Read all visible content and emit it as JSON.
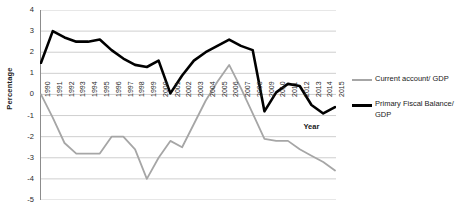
{
  "chart_data": {
    "type": "line",
    "title": "",
    "xlabel": "Year",
    "ylabel": "Percentage",
    "ylim": [
      -5,
      4
    ],
    "ytick_labels": [
      "4",
      "3",
      "2",
      "1",
      "0",
      "-1",
      "-2",
      "-3",
      "-4",
      "-5"
    ],
    "yticks": [
      4,
      3,
      2,
      1,
      0,
      -1,
      -2,
      -3,
      -4,
      -5
    ],
    "grid": true,
    "legend_position": "right",
    "x": [
      1990,
      1991,
      1992,
      1993,
      1994,
      1995,
      1996,
      1997,
      1998,
      1999,
      2000,
      2001,
      2002,
      2003,
      2004,
      2005,
      2006,
      2007,
      2008,
      2009,
      2010,
      2011,
      2012,
      2013,
      2014,
      2015
    ],
    "categories": [
      "1990",
      "1991",
      "1992",
      "1993",
      "1994",
      "1995",
      "1996",
      "1997",
      "1998",
      "1999",
      "2000",
      "2001",
      "2002",
      "2003",
      "2004",
      "2005",
      "2006",
      "2007",
      "2008",
      "2009",
      "2010",
      "2011",
      "2012",
      "2013",
      "2014",
      "2015"
    ],
    "series": [
      {
        "name": "Current account/ GDP",
        "color": "#a6a6a6",
        "width": 1.8,
        "values": [
          0.0,
          -1.1,
          -2.3,
          -2.8,
          -2.8,
          -2.8,
          -2.0,
          -2.0,
          -2.6,
          -4.0,
          -3.0,
          -2.2,
          -2.5,
          -1.4,
          -0.3,
          0.6,
          1.4,
          0.3,
          -0.9,
          -2.1,
          -2.2,
          -2.2,
          -2.6,
          -2.9,
          -3.2,
          -3.6
        ]
      },
      {
        "name": "Primary Fiscal Balance/ GDP",
        "color": "#000000",
        "width": 2.6,
        "values": [
          1.5,
          3.0,
          2.7,
          2.5,
          2.5,
          2.6,
          2.1,
          1.7,
          1.4,
          1.3,
          1.6,
          0.05,
          0.9,
          1.6,
          2.0,
          2.3,
          2.6,
          2.3,
          2.1,
          -0.8,
          0.1,
          0.5,
          0.4,
          -0.5,
          -0.9,
          -0.6
        ]
      }
    ]
  },
  "legend": {
    "items": [
      {
        "label": "Current account/ GDP",
        "color": "#a6a6a6",
        "style": "gray"
      },
      {
        "label": "Primary Fiscal Balance/ GDP",
        "color": "#000000",
        "style": "black"
      }
    ]
  },
  "axes": {
    "y_title": "Percentage",
    "x_title": "Year"
  }
}
